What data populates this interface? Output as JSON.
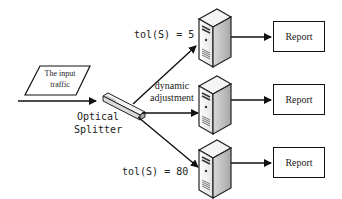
{
  "diagram": {
    "input": {
      "label_line1": "The input",
      "label_line2": "traffic"
    },
    "splitter": {
      "label_line1": "Optical",
      "label_line2": "Splitter"
    },
    "labels": {
      "top_tol": "tol(S) = 5",
      "middle_line1": "dynamic",
      "middle_line2": "adjustment",
      "bottom_tol": "tol(S) = 80"
    },
    "servers": [
      {
        "id": "server-top"
      },
      {
        "id": "server-middle"
      },
      {
        "id": "server-bottom"
      }
    ],
    "reports": [
      {
        "label": "Report"
      },
      {
        "label": "Report"
      },
      {
        "label": "Report"
      }
    ]
  }
}
